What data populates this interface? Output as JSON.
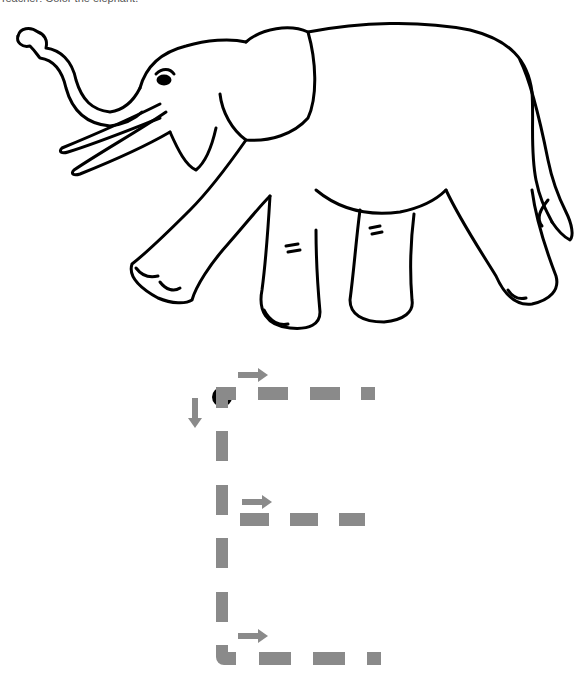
{
  "worksheet": {
    "instruction": "Teacher: Color the elephant.",
    "picture": "elephant",
    "letter": "E",
    "colors": {
      "guide_dash": "#8a8a8a",
      "arrow": "#8a8a8a",
      "start_dot": "#000000",
      "outline": "#000000"
    }
  }
}
